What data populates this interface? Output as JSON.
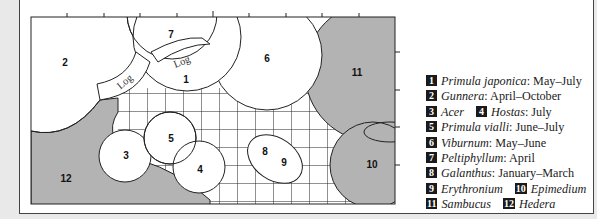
{
  "diagram": {
    "type": "garden-planting-plan",
    "colors": {
      "page_background": "#e9e9e9",
      "plan_background": "#ffffff",
      "shaded_area": "#b3b3b3",
      "outline": "#222222",
      "legend_badge": "#1a1a1a"
    },
    "bed_labels": {
      "n1": "1",
      "n2": "2",
      "n3": "3",
      "n4": "4",
      "n5": "5",
      "n6": "6",
      "n7": "7",
      "n8": "8",
      "n9": "9",
      "n10": "10",
      "n11": "11",
      "n12": "12"
    },
    "log_labels": [
      "Log",
      "Log"
    ],
    "legend": [
      [
        {
          "num": "1",
          "name": "Primula japonica",
          "season": ": May–July"
        }
      ],
      [
        {
          "num": "2",
          "name": "Gunnera",
          "season": ": April–October"
        }
      ],
      [
        {
          "num": "3",
          "name": "Acer",
          "season": ""
        },
        {
          "num": "4",
          "name": "Hostas",
          "season": ": July"
        }
      ],
      [
        {
          "num": "5",
          "name": "Primula vialli",
          "season": ": June–July"
        }
      ],
      [
        {
          "num": "6",
          "name": "Viburnum",
          "season": ": May–June"
        }
      ],
      [
        {
          "num": "7",
          "name": "Peltiphyllum",
          "season": ": April"
        }
      ],
      [
        {
          "num": "8",
          "name": "Galanthus",
          "season": ": January–March"
        }
      ],
      [
        {
          "num": "9",
          "name": "Erythronium",
          "season": ""
        },
        {
          "num": "10",
          "name": "Epimedium",
          "season": ""
        }
      ],
      [
        {
          "num": "11",
          "name": "Sambucus",
          "season": ""
        },
        {
          "num": "12",
          "name": "Hedera",
          "season": ""
        }
      ]
    ]
  }
}
